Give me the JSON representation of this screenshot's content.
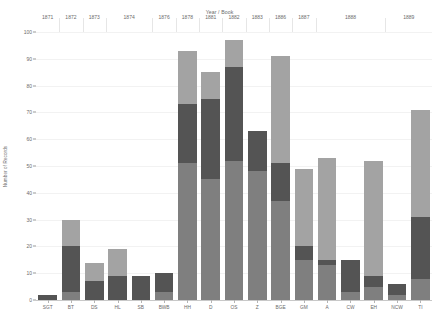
{
  "chart_data": {
    "type": "bar",
    "title": "Year / Book",
    "xlabel": "Year / Book",
    "ylabel": "Number of Records",
    "ylim": [
      0,
      100
    ],
    "ytick_values": [
      0,
      10,
      20,
      30,
      40,
      50,
      60,
      70,
      80,
      90,
      100
    ],
    "ytick_labels": [
      "0",
      "10",
      "20",
      "30",
      "40",
      "50",
      "60",
      "70",
      "80",
      "90",
      "100"
    ],
    "grid": true,
    "legend": "none",
    "stacked": true,
    "orientation": "vertical",
    "series": [
      {
        "name": "segment-1",
        "color": "#7f7f7f"
      },
      {
        "name": "segment-2",
        "color": "#545454"
      },
      {
        "name": "segment-3",
        "color": "#a3a3a3"
      }
    ],
    "categories": [
      "SGT",
      "BT",
      "DS",
      "HL",
      "SB",
      "BWB",
      "HH",
      "D",
      "OS",
      "Z",
      "BGE",
      "GM",
      "A",
      "CW",
      "EH",
      "NCW",
      "TI"
    ],
    "groups": [
      {
        "label": "1871",
        "categories": [
          "SGT"
        ]
      },
      {
        "label": "1872",
        "categories": [
          "BT"
        ]
      },
      {
        "label": "1873",
        "categories": [
          "DS"
        ]
      },
      {
        "label": "1874",
        "categories": [
          "HL",
          "SB"
        ]
      },
      {
        "label": "1876",
        "categories": [
          "BWB"
        ]
      },
      {
        "label": "1878",
        "categories": [
          "HH"
        ]
      },
      {
        "label": "1881",
        "categories": [
          "D"
        ]
      },
      {
        "label": "1882",
        "categories": [
          "OS"
        ]
      },
      {
        "label": "1883",
        "categories": [
          "Z"
        ]
      },
      {
        "label": "1886",
        "categories": [
          "BGE"
        ]
      },
      {
        "label": "1887",
        "categories": [
          "GM"
        ]
      },
      {
        "label": "1888",
        "categories": [
          "A",
          "CW",
          "EH"
        ]
      },
      {
        "label": "1889",
        "categories": [
          "NCW",
          "TI"
        ]
      }
    ],
    "stacks": [
      {
        "category": "SGT",
        "values": [
          0,
          2,
          0
        ],
        "total": 2
      },
      {
        "category": "BT",
        "values": [
          3,
          17,
          10
        ],
        "total": 30
      },
      {
        "category": "DS",
        "values": [
          0,
          7,
          7
        ],
        "total": 14
      },
      {
        "category": "HL",
        "values": [
          0,
          9,
          10
        ],
        "total": 19
      },
      {
        "category": "SB",
        "values": [
          0,
          9,
          0
        ],
        "total": 9
      },
      {
        "category": "BWB",
        "values": [
          3,
          7,
          0
        ],
        "total": 10
      },
      {
        "category": "HH",
        "values": [
          51,
          22,
          20
        ],
        "total": 93
      },
      {
        "category": "D",
        "values": [
          45,
          30,
          10
        ],
        "total": 85
      },
      {
        "category": "OS",
        "values": [
          52,
          35,
          10
        ],
        "total": 97
      },
      {
        "category": "Z",
        "values": [
          48,
          15,
          0
        ],
        "total": 63
      },
      {
        "category": "BGE",
        "values": [
          37,
          14,
          40
        ],
        "total": 91
      },
      {
        "category": "GM",
        "values": [
          15,
          5,
          29
        ],
        "total": 49
      },
      {
        "category": "A",
        "values": [
          13,
          2,
          38
        ],
        "total": 53
      },
      {
        "category": "CW",
        "values": [
          3,
          12,
          0
        ],
        "total": 15
      },
      {
        "category": "EH",
        "values": [
          5,
          4,
          43
        ],
        "total": 52
      },
      {
        "category": "NCW",
        "values": [
          2,
          4,
          0
        ],
        "total": 6
      },
      {
        "category": "TI",
        "values": [
          8,
          23,
          40
        ],
        "total": 71
      }
    ]
  }
}
